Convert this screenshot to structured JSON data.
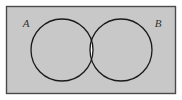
{
  "diagram": {
    "type": "venn-diagram",
    "labels": {
      "set_a": "A",
      "set_b": "B"
    },
    "colors": {
      "universe_fill": "#c8c8c8",
      "universe_border": "#4a4a4a",
      "circle_stroke": "#1a1a1a",
      "intersection_fill": "#ffffff",
      "label_color": "#333333",
      "page_background": "#ffffff"
    },
    "geometry": {
      "universe_rect": {
        "x": 6,
        "y": 6,
        "width": 170,
        "height": 88
      },
      "circle_a": {
        "cx": 62,
        "cy": 50,
        "r": 31
      },
      "circle_b": {
        "cx": 121,
        "cy": 50,
        "r": 31
      },
      "label_a_pos": {
        "x": 26,
        "y": 27
      },
      "label_b_pos": {
        "x": 158,
        "y": 27
      }
    },
    "shading": {
      "region_a_only": "shaded",
      "region_b_only": "shaded",
      "region_intersection": "unshaded",
      "region_outside_both": "shaded"
    }
  }
}
